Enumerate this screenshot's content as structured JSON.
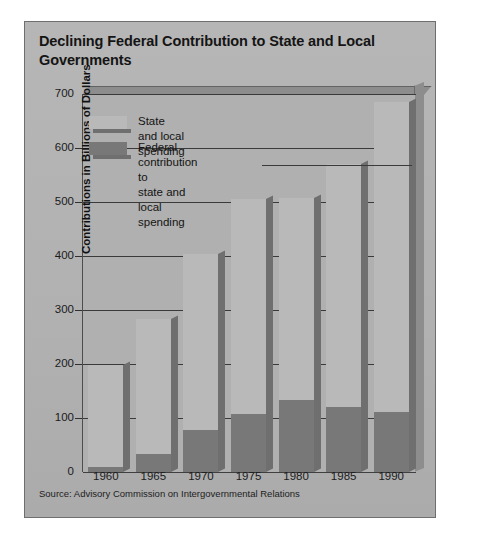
{
  "card": {
    "title": "Declining Federal Contribution to State and Local Governments",
    "source": "Source: Advisory Commission on Intergovernmental Relations"
  },
  "legend": {
    "items": [
      {
        "label": "State and local spending",
        "color": "#b9b9b9"
      },
      {
        "label": "Federal contribution to\nstate and local spending",
        "color": "#787878"
      }
    ]
  },
  "axes": {
    "y_title": "Contributions in Billions of Dollars",
    "y_ticks": [
      "700",
      "600",
      "500",
      "400",
      "300",
      "200",
      "100",
      "0"
    ],
    "x_ticks": [
      "1960",
      "1965",
      "1970",
      "1975",
      "1980",
      "1985",
      "1990"
    ]
  },
  "chart_data": {
    "type": "bar",
    "title": "Declining Federal Contribution to State and Local Governments",
    "subtitle": "",
    "xlabel": "",
    "ylabel": "Contributions in Billions of Dollars",
    "ylim": [
      0,
      700
    ],
    "ytick_step": 100,
    "grid": true,
    "stacked": true,
    "legend_position": "top-left",
    "annotation": "Source: Advisory Commission on Intergovernmental Relations",
    "categories": [
      "1960",
      "1965",
      "1970",
      "1975",
      "1980",
      "1985",
      "1990"
    ],
    "series": [
      {
        "name": "Federal contribution to state and local spending",
        "color": "#787878",
        "values": [
          10,
          33,
          77,
          108,
          133,
          120,
          112
        ]
      },
      {
        "name": "State and local spending",
        "color": "#b9b9b9",
        "values": [
          198,
          283,
          403,
          506,
          507,
          570,
          685
        ],
        "note": "bar total height (state and local spending, inclusive of federal portion shown dark)"
      }
    ]
  }
}
